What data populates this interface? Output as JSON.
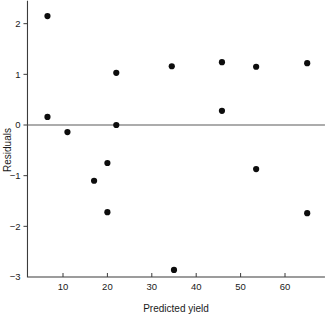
{
  "chart_data": {
    "type": "scatter",
    "title": "",
    "xlabel": "Predicted yield",
    "ylabel": "Residuals",
    "xlim": [
      2,
      69
    ],
    "ylim": [
      -3,
      2.45
    ],
    "xticks": [
      10,
      20,
      30,
      40,
      50,
      60
    ],
    "xtick_labels": [
      "10",
      "20",
      "30",
      "40",
      "50",
      "60"
    ],
    "yticks": [
      2,
      1,
      0,
      -1,
      -2,
      -3
    ],
    "ytick_labels": [
      "2",
      "1",
      "0",
      "−1",
      "−2",
      "−3"
    ],
    "grid": false,
    "legend": null,
    "reference_lines": [
      {
        "name": "zero-residual-line",
        "orientation": "horizontal",
        "y": 0
      }
    ],
    "marker": {
      "shape": "circle",
      "color": "#0d0d0d",
      "size": 3.1
    },
    "points": [
      {
        "x": 6.5,
        "y": 2.15
      },
      {
        "x": 6.5,
        "y": 0.16
      },
      {
        "x": 11.0,
        "y": -0.14
      },
      {
        "x": 17.0,
        "y": -1.1
      },
      {
        "x": 20.0,
        "y": -0.75
      },
      {
        "x": 20.0,
        "y": -1.72
      },
      {
        "x": 22.0,
        "y": 1.03
      },
      {
        "x": 22.0,
        "y": 0.0
      },
      {
        "x": 34.5,
        "y": 1.16
      },
      {
        "x": 35.0,
        "y": -2.86
      },
      {
        "x": 45.8,
        "y": 1.24
      },
      {
        "x": 45.8,
        "y": 0.28
      },
      {
        "x": 53.5,
        "y": 1.15
      },
      {
        "x": 53.5,
        "y": -0.87
      },
      {
        "x": 65.0,
        "y": 1.22
      },
      {
        "x": 65.0,
        "y": -1.74
      }
    ],
    "x_values": [
      6.5,
      6.5,
      11.0,
      17.0,
      20.0,
      20.0,
      22.0,
      22.0,
      34.5,
      35.0,
      45.8,
      45.8,
      53.5,
      53.5,
      65.0,
      65.0
    ],
    "y_values": [
      2.15,
      0.16,
      -0.14,
      -1.1,
      -0.75,
      -1.72,
      1.03,
      0.0,
      1.16,
      -2.86,
      1.24,
      0.28,
      1.15,
      -0.87,
      1.22,
      -1.74
    ]
  },
  "colors": {
    "marker": "#0d0d0d",
    "axis": "#3b3b3b",
    "zero_line": "#5a5a5a",
    "background": "#ffffff",
    "text": "#1a1a1a"
  }
}
